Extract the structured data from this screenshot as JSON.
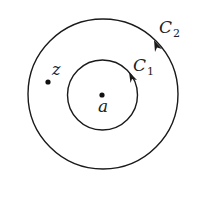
{
  "diagram": {
    "type": "concentric-contours",
    "center_point": {
      "label": "a"
    },
    "outside_point": {
      "label": "z"
    },
    "inner_contour": {
      "label": "C",
      "subscript": "1",
      "orientation": "counterclockwise"
    },
    "outer_contour": {
      "label": "C",
      "subscript": "2",
      "orientation": "counterclockwise"
    },
    "colors": {
      "stroke": "#1a1a1a",
      "background": "#ffffff"
    }
  }
}
